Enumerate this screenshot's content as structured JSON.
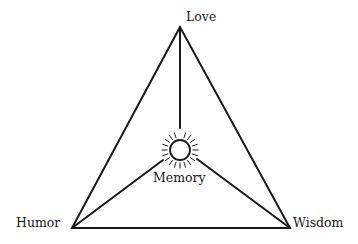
{
  "diagram": {
    "type": "triangle-with-center",
    "vertices": [
      {
        "id": "love",
        "label": "Love"
      },
      {
        "id": "humor",
        "label": "Humor"
      },
      {
        "id": "wisdom",
        "label": "Wisdom"
      }
    ],
    "center": {
      "id": "memory",
      "label": "Memory",
      "icon": "sun-icon"
    },
    "edges": [
      {
        "from": "love",
        "to": "humor"
      },
      {
        "from": "love",
        "to": "wisdom"
      },
      {
        "from": "humor",
        "to": "wisdom"
      },
      {
        "from": "love",
        "to": "memory"
      },
      {
        "from": "humor",
        "to": "memory"
      },
      {
        "from": "wisdom",
        "to": "memory"
      }
    ],
    "stroke_color": "#1a1a1a",
    "background_color": "#ffffff"
  }
}
